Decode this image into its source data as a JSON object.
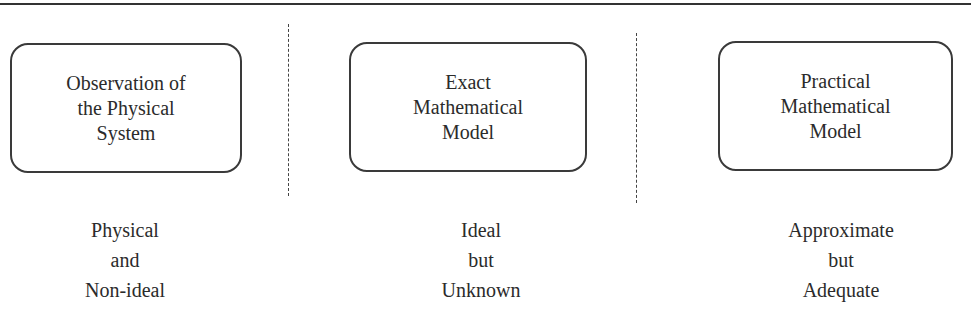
{
  "boxes": [
    {
      "label": "Observation of\nthe Physical\nSystem"
    },
    {
      "label": "Exact\nMathematical\nModel"
    },
    {
      "label": "Practical\nMathematical\nModel"
    }
  ],
  "captions": [
    {
      "label": "Physical\nand\nNon-ideal"
    },
    {
      "label": "Ideal\nbut\nUnknown"
    },
    {
      "label": "Approximate\nbut\nAdequate"
    }
  ]
}
